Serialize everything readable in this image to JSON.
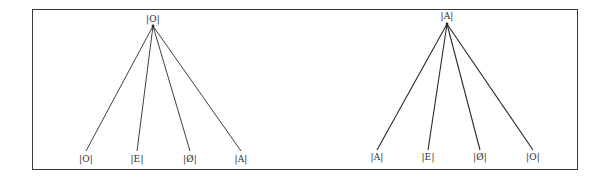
{
  "figure": {
    "type": "tree-diagram",
    "trees": [
      {
        "name": "left-tree",
        "root": {
          "label": "|O|",
          "x": 153,
          "y": 16
        },
        "apex": {
          "x": 153,
          "y": 26
        },
        "leaves": [
          {
            "label": "|O|",
            "x": 86,
            "y": 155
          },
          {
            "label": "|E|",
            "x": 137,
            "y": 155
          },
          {
            "label": "|Ø|",
            "x": 190,
            "y": 155
          },
          {
            "label": "|A|",
            "x": 241,
            "y": 155
          }
        ],
        "leaf_line_end_y": 151
      },
      {
        "name": "right-tree",
        "root": {
          "label": "|A|",
          "x": 447,
          "y": 13
        },
        "apex": {
          "x": 447,
          "y": 24
        },
        "leaves": [
          {
            "label": "|A|",
            "x": 377,
            "y": 153
          },
          {
            "label": "|E|",
            "x": 428,
            "y": 153
          },
          {
            "label": "|Ø|",
            "x": 480,
            "y": 153
          },
          {
            "label": "|O|",
            "x": 533,
            "y": 153
          }
        ],
        "leaf_line_end_y": 150
      }
    ],
    "colors": {
      "line": "#2a2a2a",
      "frame": "#3a3a3a",
      "text": "#2a2a2a",
      "background": "#ffffff"
    }
  }
}
